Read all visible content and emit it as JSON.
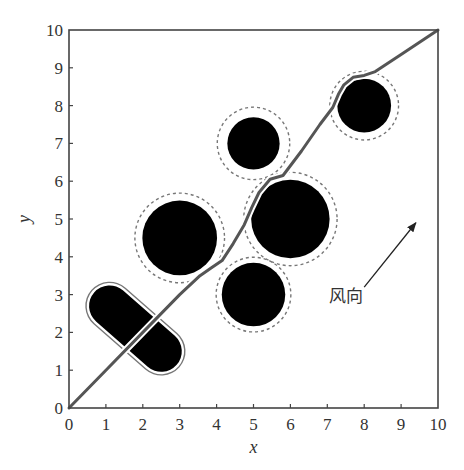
{
  "chart_data": {
    "type": "scatter",
    "title": "",
    "xlabel": "x",
    "ylabel": "y",
    "xlim": [
      0,
      10
    ],
    "ylim": [
      0,
      10
    ],
    "grid": false,
    "legend": null,
    "x_ticks": [
      0,
      1,
      2,
      3,
      4,
      5,
      6,
      7,
      8,
      9,
      10
    ],
    "y_ticks": [
      0,
      1,
      2,
      3,
      4,
      5,
      6,
      7,
      8,
      9,
      10
    ],
    "x_tick_labels": [
      "0",
      "1",
      "2",
      "3",
      "4",
      "5",
      "6",
      "7",
      "8",
      "9",
      "10"
    ],
    "y_tick_labels": [
      "0",
      "1",
      "2",
      "3",
      "4",
      "5",
      "6",
      "7",
      "8",
      "9",
      "10"
    ],
    "obstacles": [
      {
        "shape": "capsule",
        "x1": 1.1,
        "y1": 2.7,
        "x2": 2.5,
        "y2": 1.5,
        "radius": 0.55,
        "safety_radius": 0.65
      },
      {
        "shape": "circle",
        "cx": 3.0,
        "cy": 4.5,
        "radius": 1.0,
        "safety_radius": 1.2
      },
      {
        "shape": "circle",
        "cx": 5.0,
        "cy": 3.0,
        "radius": 0.85,
        "safety_radius": 1.0
      },
      {
        "shape": "circle",
        "cx": 5.0,
        "cy": 7.0,
        "radius": 0.7,
        "safety_radius": 0.97
      },
      {
        "shape": "circle",
        "cx": 6.0,
        "cy": 5.0,
        "radius": 1.05,
        "safety_radius": 1.25
      },
      {
        "shape": "circle",
        "cx": 8.0,
        "cy": 8.0,
        "radius": 0.72,
        "safety_radius": 0.92
      }
    ],
    "series": [
      {
        "name": "path",
        "type": "line",
        "color": "#555555",
        "x": [
          0,
          1.0,
          2.0,
          3.0,
          3.55,
          3.85,
          4.15,
          4.45,
          4.75,
          4.95,
          5.15,
          5.45,
          5.8,
          6.3,
          6.8,
          7.15,
          7.3,
          7.45,
          7.7,
          8.0,
          8.3,
          9.0,
          10.0
        ],
        "y": [
          0,
          1.0,
          2.0,
          3.0,
          3.5,
          3.7,
          3.9,
          4.35,
          4.85,
          5.3,
          5.7,
          6.05,
          6.15,
          6.8,
          7.5,
          7.95,
          8.3,
          8.55,
          8.75,
          8.8,
          8.9,
          9.35,
          10.0
        ]
      }
    ],
    "annotations": [
      {
        "text": "风向",
        "x": 7.5,
        "y": 2.8,
        "arrow": {
          "from": [
            8.0,
            3.2
          ],
          "to": [
            9.4,
            4.9
          ]
        }
      }
    ],
    "colors": {
      "obstacle": "#000000",
      "safety_ring": "#777777",
      "path": "#555555",
      "axis": "#444444"
    }
  },
  "plot": {
    "x0_px": 69,
    "x1_px": 438,
    "y0_px": 408,
    "y1_px": 30
  }
}
